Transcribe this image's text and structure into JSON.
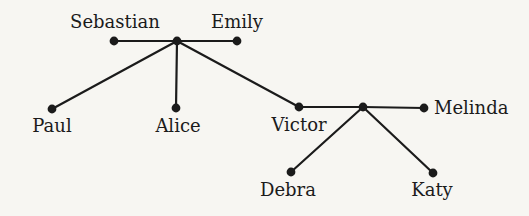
{
  "figure": {
    "type": "family-tree-graph",
    "colors": {
      "background": "#f7f6f2",
      "ink": "#1b1b1b"
    },
    "nodes": [
      {
        "id": "sebastian",
        "label": "Sebastian",
        "x": 114,
        "y": 41,
        "label_x": 115,
        "label_y": 28,
        "label_anchor": "middle"
      },
      {
        "id": "union-top",
        "label": "",
        "x": 177,
        "y": 41
      },
      {
        "id": "emily",
        "label": "Emily",
        "x": 237,
        "y": 41,
        "label_x": 237,
        "label_y": 28,
        "label_anchor": "middle"
      },
      {
        "id": "paul",
        "label": "Paul",
        "x": 52,
        "y": 109,
        "label_x": 52,
        "label_y": 132,
        "label_anchor": "middle"
      },
      {
        "id": "alice",
        "label": "Alice",
        "x": 176,
        "y": 108,
        "label_x": 178,
        "label_y": 132,
        "label_anchor": "middle"
      },
      {
        "id": "victor",
        "label": "Victor",
        "x": 299,
        "y": 107,
        "label_x": 299,
        "label_y": 131,
        "label_anchor": "middle"
      },
      {
        "id": "union-right",
        "label": "",
        "x": 363,
        "y": 107
      },
      {
        "id": "melinda",
        "label": "Melinda",
        "x": 424,
        "y": 108,
        "label_x": 434,
        "label_y": 114,
        "label_anchor": "start"
      },
      {
        "id": "debra",
        "label": "Debra",
        "x": 291,
        "y": 172,
        "label_x": 288,
        "label_y": 196,
        "label_anchor": "middle"
      },
      {
        "id": "katy",
        "label": "Katy",
        "x": 433,
        "y": 173,
        "label_x": 432,
        "label_y": 196,
        "label_anchor": "middle"
      }
    ],
    "edges": [
      [
        "sebastian",
        "union-top"
      ],
      [
        "union-top",
        "emily"
      ],
      [
        "union-top",
        "paul"
      ],
      [
        "union-top",
        "alice"
      ],
      [
        "union-top",
        "victor"
      ],
      [
        "victor",
        "union-right"
      ],
      [
        "union-right",
        "melinda"
      ],
      [
        "union-right",
        "debra"
      ],
      [
        "union-right",
        "katy"
      ]
    ]
  }
}
